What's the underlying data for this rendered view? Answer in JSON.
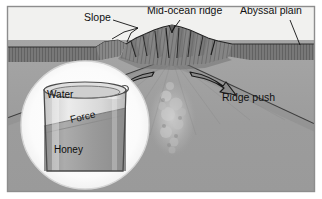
{
  "figure": {
    "frame": {
      "border_color": "#8d8d8d",
      "background_color": "#ffffff"
    },
    "palette": {
      "water_color": "#f1f1ef",
      "crust_dark": "#6f6f6f",
      "crust_mid": "#7c7c7c",
      "mantle_grey": "#9b9b9b",
      "mantle_light": "#a8a8a8",
      "arrow_fill": "#8a8a8a",
      "arrow_stroke": "#1a1a1a",
      "plume_light": "#c9c9c9",
      "inset_circle_fill": "#fbfbfb",
      "beaker_glass": "#cfcfcf",
      "honey_fill": "#9d9d9d",
      "water_fill": "#dedede",
      "label_color": "#101010",
      "leader_line_color": "#111111"
    },
    "labels": [
      {
        "id": "slope",
        "text": "Slope",
        "x": 84,
        "y": 21
      },
      {
        "id": "mid-ocean-ridge",
        "text": "Mid-ocean ridge",
        "x": 147,
        "y": 14
      },
      {
        "id": "abyssal-plain",
        "text": "Abyssal plain",
        "x": 240,
        "y": 14
      },
      {
        "id": "ridge-push",
        "text": "Ridge push",
        "x": 222,
        "y": 101
      }
    ],
    "inset": {
      "name": "honey-water-beaker-analogy",
      "labels": [
        {
          "id": "water",
          "text": "Water",
          "x": 47,
          "y": 98
        },
        {
          "id": "force",
          "text": "Force",
          "x": 71,
          "y": 123
        },
        {
          "id": "honey",
          "text": "Honey",
          "x": 54,
          "y": 153
        }
      ]
    },
    "arrows": [
      {
        "id": "spreading-arrow-left",
        "direction": "left",
        "label": ""
      },
      {
        "id": "spreading-arrow-right",
        "direction": "right",
        "label": ""
      }
    ]
  }
}
